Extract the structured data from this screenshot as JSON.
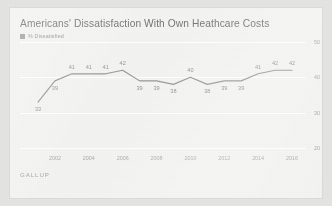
{
  "chart_data": {
    "type": "line",
    "title": "Americans' Dissatisfaction With Own Heathcare Costs",
    "xlabel": "",
    "ylabel": "",
    "ylim": [
      20,
      50
    ],
    "grid": true,
    "legend_position": "top-left",
    "source": "GALLUP",
    "legend": [
      {
        "name": "% Dissatisfied",
        "color": "#8f8f8f",
        "marker": "square"
      }
    ],
    "y_ticks": [
      50,
      40,
      30,
      20
    ],
    "x_ticks": [
      "2002",
      "2004",
      "2006",
      "2008",
      "2010",
      "2012",
      "2014",
      "2016"
    ],
    "x": [
      2001,
      2002,
      2003,
      2004,
      2005,
      2006,
      2007,
      2008,
      2009,
      2010,
      2011,
      2012,
      2013,
      2014,
      2015,
      2016
    ],
    "series": [
      {
        "name": "% Dissatisfied",
        "color": "#8f8f8f",
        "values": [
          33,
          39,
          41,
          41,
          41,
          42,
          39,
          39,
          38,
          40,
          38,
          39,
          39,
          41,
          42,
          42
        ],
        "labels": [
          "33",
          "39",
          "41",
          "41",
          "41",
          "42",
          "39",
          "39",
          "38",
          "40",
          "38",
          "39",
          "39",
          "41",
          "42",
          "42"
        ],
        "label_positions": [
          "below",
          "below",
          "above",
          "above",
          "above",
          "above",
          "below",
          "below",
          "below",
          "above",
          "below",
          "below",
          "below",
          "above",
          "above",
          "above"
        ]
      }
    ]
  },
  "colors": {
    "page_background": "#e4e4e2",
    "card_background": "#f2f2f0",
    "line": "#8f8f8f",
    "gridline": "#ffffff",
    "title_text": "#6a6a6a",
    "axis_text": "#a0a0a0",
    "label_text": "#8e8e8e",
    "source_text": "#9e9e9e"
  }
}
